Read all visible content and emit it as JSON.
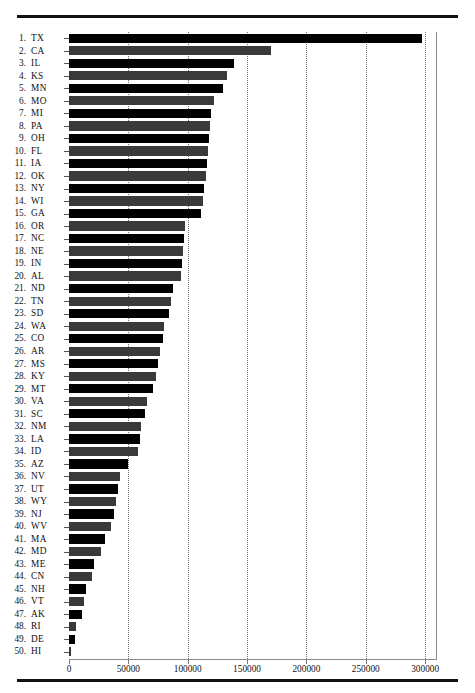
{
  "document": {
    "running_head": "",
    "rule_top": "horizontal-rule",
    "rule_bottom": "horizontal-rule"
  },
  "chart_data": {
    "type": "bar",
    "orientation": "horizontal",
    "title": "",
    "subtitle": "",
    "xlabel": "",
    "ylabel": "",
    "xlim": [
      0,
      310000
    ],
    "xticks": [
      0,
      50000,
      100000,
      150000,
      200000,
      250000,
      300000
    ],
    "xticklabels": [
      "0",
      "50000",
      "100000",
      "150000",
      "200000",
      "250000",
      "300000"
    ],
    "grid": "vertical-dotted",
    "legend": "none",
    "bar_colors": [
      "#000000",
      "#3a3a3a"
    ],
    "categories": [
      "TX",
      "CA",
      "IL",
      "KS",
      "MN",
      "MO",
      "MI",
      "PA",
      "OH",
      "FL",
      "IA",
      "OK",
      "NY",
      "WI",
      "GA",
      "OR",
      "NC",
      "NE",
      "IN",
      "AL",
      "ND",
      "TN",
      "SD",
      "WA",
      "CO",
      "AR",
      "MS",
      "KY",
      "MT",
      "VA",
      "SC",
      "NM",
      "LA",
      "ID",
      "AZ",
      "NV",
      "UT",
      "WY",
      "NJ",
      "WV",
      "MA",
      "MD",
      "ME",
      "CN",
      "NH",
      "VT",
      "AK",
      "RI",
      "DE",
      "HI"
    ],
    "ranks": [
      "1.",
      "2.",
      "3.",
      "4.",
      "5.",
      "6.",
      "7.",
      "8.",
      "9.",
      "10.",
      "11.",
      "12.",
      "13.",
      "14.",
      "15.",
      "16.",
      "17.",
      "18.",
      "19.",
      "20.",
      "21.",
      "22.",
      "23.",
      "24.",
      "25.",
      "26.",
      "27.",
      "28.",
      "29.",
      "30.",
      "31.",
      "32.",
      "33.",
      "34.",
      "35.",
      "36.",
      "37.",
      "38.",
      "39.",
      "40.",
      "41.",
      "42.",
      "43.",
      "44.",
      "45.",
      "46.",
      "47.",
      "48.",
      "49.",
      "50."
    ],
    "values": [
      297000,
      170000,
      139000,
      133000,
      130000,
      122000,
      120000,
      119000,
      118000,
      117000,
      116000,
      115000,
      114000,
      113000,
      111000,
      98000,
      97000,
      96000,
      95000,
      94000,
      88000,
      86000,
      84000,
      80000,
      79000,
      77000,
      75000,
      73000,
      71000,
      66000,
      64000,
      61000,
      60000,
      58000,
      50000,
      43000,
      41000,
      40000,
      38000,
      35000,
      30000,
      27000,
      21000,
      19000,
      14000,
      13000,
      11000,
      6000,
      5000,
      2000
    ]
  }
}
